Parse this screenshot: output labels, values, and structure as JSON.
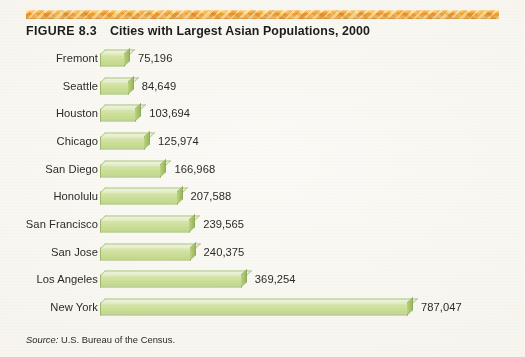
{
  "figure": {
    "number_label": "FIGURE 8.3",
    "title": "Cities with Largest Asian Populations, 2000",
    "source_lead": "Source:",
    "source_text": "U.S. Bureau of the Census.",
    "accent_rule_color": "#eb8f23",
    "bar_fill_color": "#cddf9a",
    "bar_top_color": "#e7efcc",
    "bar_edge_color": "#9cb86a",
    "background_color": "#f6f4ed",
    "text_color": "#2b2b28"
  },
  "chart_data": {
    "type": "bar",
    "orientation": "horizontal",
    "title": "Cities with Largest Asian Populations, 2000",
    "xlabel": "",
    "ylabel": "",
    "grid": false,
    "legend": "none",
    "xlim": [
      0,
      787047
    ],
    "categories": [
      "Fremont",
      "Seattle",
      "Houston",
      "Chicago",
      "San Diego",
      "Honolulu",
      "San Francisco",
      "San Jose",
      "Los Angeles",
      "New York"
    ],
    "values": [
      75196,
      84649,
      103694,
      125974,
      166968,
      207588,
      239565,
      240375,
      369254,
      787047
    ],
    "value_labels": [
      "75,196",
      "84,649",
      "103,694",
      "125,974",
      "166,968",
      "207,588",
      "239,565",
      "240,375",
      "369,254",
      "787,047"
    ],
    "source": "Source: U.S. Bureau of the Census."
  }
}
